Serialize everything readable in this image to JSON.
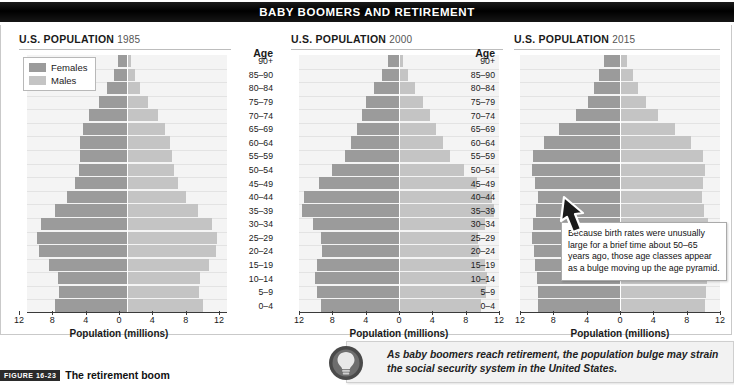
{
  "banner": {
    "title": "BABY BOOMERS AND RETIREMENT"
  },
  "legend": {
    "females_label": "Females",
    "males_label": "Males",
    "females_color": "#9b9b9b",
    "males_color": "#c4c4c4"
  },
  "age_header": "Age",
  "age_groups": [
    "90+",
    "85–90",
    "80–84",
    "75–79",
    "70–74",
    "65–69",
    "60–64",
    "55–59",
    "50–54",
    "45–49",
    "40–44",
    "35–39",
    "30–34",
    "25–29",
    "20–24",
    "15–19",
    "10–14",
    "5–9",
    "0–4"
  ],
  "xaxis": {
    "ticks": [
      "12",
      "8",
      "4",
      "0",
      "4",
      "8",
      "12"
    ],
    "label": "Population (millions)"
  },
  "panels": [
    {
      "title": "U.S. POPULATION",
      "year": "1985"
    },
    {
      "title": "U.S. POPULATION",
      "year": "2000"
    },
    {
      "title": "U.S. POPULATION",
      "year": "2015"
    }
  ],
  "callout": {
    "text": "Because birth rates were unusually large for a brief time about 50–65 years ago, those age classes appear as a bulge moving up the age pyramid."
  },
  "tip": {
    "text": "As baby boomers reach retirement, the population bulge may strain the social security system in the United States.",
    "icon": "lightbulb-icon"
  },
  "figure_caption": {
    "badge": "FIGURE 16-23",
    "text": "The retirement boom"
  },
  "chart_data": {
    "type": "bar",
    "subtype": "population-pyramid",
    "title": "BABY BOOMERS AND RETIREMENT",
    "xlabel": "Population (millions)",
    "ylabel": "Age",
    "xlim": [
      -12,
      12
    ],
    "xticks": [
      12,
      8,
      4,
      0,
      4,
      8,
      12
    ],
    "grid": true,
    "legend_position": "top-left",
    "categories": [
      "90+",
      "85–90",
      "80–84",
      "75–79",
      "70–74",
      "65–69",
      "60–64",
      "55–59",
      "50–54",
      "45–49",
      "40–44",
      "35–39",
      "30–34",
      "25–29",
      "20–24",
      "15–19",
      "10–14",
      "5–9",
      "0–4"
    ],
    "charts": [
      {
        "title": "U.S. POPULATION 1985",
        "year": 1985,
        "series": [
          {
            "name": "Females",
            "side": "left",
            "values": [
              1.1,
              1.6,
              2.4,
              3.4,
              4.6,
              5.3,
              5.6,
              5.7,
              5.8,
              6.3,
              7.2,
              8.6,
              10.3,
              10.8,
              10.6,
              9.4,
              8.3,
              8.2,
              8.6
            ]
          },
          {
            "name": "Males",
            "side": "right",
            "values": [
              0.5,
              0.9,
              1.6,
              2.5,
              3.7,
              4.6,
              5.1,
              5.4,
              5.6,
              6.1,
              7.1,
              8.5,
              10.2,
              10.8,
              10.7,
              9.8,
              8.7,
              8.6,
              9.1
            ]
          }
        ]
      },
      {
        "title": "U.S. POPULATION 2000",
        "year": 2000,
        "series": [
          {
            "name": "Females",
            "side": "left",
            "values": [
              1.3,
              2.1,
              3.0,
              4.0,
              4.5,
              5.1,
              5.8,
              6.5,
              8.1,
              9.6,
              11.4,
              11.6,
              10.3,
              9.4,
              9.3,
              9.8,
              10.1,
              9.9,
              9.4
            ]
          },
          {
            "name": "Males",
            "side": "right",
            "values": [
              0.5,
              1.1,
              1.9,
              2.9,
              3.7,
              4.4,
              5.3,
              6.1,
              7.8,
              9.4,
              11.1,
              11.4,
              10.3,
              9.5,
              9.6,
              10.3,
              10.6,
              10.4,
              9.8
            ]
          }
        ]
      },
      {
        "title": "U.S. POPULATION 2015",
        "year": 2015,
        "series": [
          {
            "name": "Females",
            "side": "left",
            "values": [
              1.9,
              2.5,
              3.1,
              3.9,
              5.3,
              7.3,
              9.1,
              10.4,
              10.6,
              10.2,
              9.9,
              10.1,
              10.4,
              10.6,
              10.3,
              10.2,
              10.0,
              9.9,
              9.8
            ]
          },
          {
            "name": "Males",
            "side": "right",
            "values": [
              0.8,
              1.5,
              2.2,
              3.1,
              4.6,
              6.6,
              8.5,
              9.9,
              10.2,
              10.0,
              9.8,
              10.1,
              10.5,
              10.8,
              10.7,
              10.7,
              10.4,
              10.3,
              10.2
            ]
          }
        ]
      }
    ]
  }
}
